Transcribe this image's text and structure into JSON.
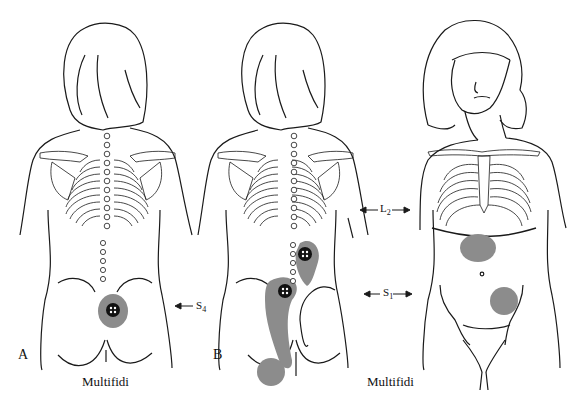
{
  "figure": {
    "panels": [
      {
        "letter": "A",
        "view": "posterior",
        "caption": "Multifidi",
        "level_label": "S",
        "level_sub": "4"
      },
      {
        "letter": "B",
        "view": "posterior",
        "caption": "Multifidi",
        "level_labels": [
          {
            "label": "L",
            "sub": "2"
          },
          {
            "label": "S",
            "sub": "1"
          }
        ]
      },
      {
        "letter": "",
        "view": "anterior"
      }
    ],
    "labels": {
      "panel_a": "A",
      "panel_b": "B",
      "caption_a": "Multifidi",
      "caption_b": "Multifidi",
      "s4": "S",
      "s4_sub": "4",
      "l2": "L",
      "l2_sub": "2",
      "s1": "S",
      "s1_sub": "1"
    },
    "colors": {
      "line": "#1a1a1a",
      "referral_gray": "#8c8c8c",
      "trigger_black": "#111111",
      "background": "#ffffff"
    }
  }
}
